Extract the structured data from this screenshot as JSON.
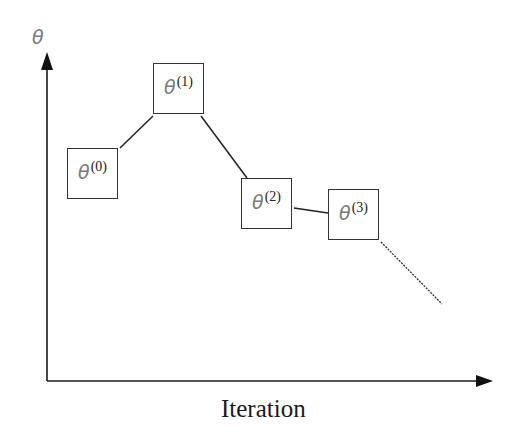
{
  "diagram": {
    "y_axis": {
      "label": "θ"
    },
    "x_axis": {
      "label": "Iteration"
    },
    "nodes": [
      {
        "id": "theta-0",
        "symbol": "θ",
        "superscript": "(0)",
        "x": 67,
        "y": 148
      },
      {
        "id": "theta-1",
        "symbol": "θ",
        "superscript": "(1)",
        "x": 153,
        "y": 63
      },
      {
        "id": "theta-2",
        "symbol": "θ",
        "superscript": "(2)",
        "x": 241,
        "y": 178
      },
      {
        "id": "theta-3",
        "symbol": "θ",
        "superscript": "(3)",
        "x": 328,
        "y": 189
      }
    ],
    "edges": [
      {
        "from": "theta-0",
        "to": "theta-1",
        "style": "solid"
      },
      {
        "from": "theta-1",
        "to": "theta-2",
        "style": "solid"
      },
      {
        "from": "theta-2",
        "to": "theta-3",
        "style": "solid"
      },
      {
        "from": "theta-3",
        "to": "continuation",
        "style": "dotted"
      }
    ],
    "colors": {
      "axis": "#1a1a1a",
      "box_border": "#333333",
      "edge": "#222222",
      "theta_glyph": "#7a7a7a"
    }
  }
}
